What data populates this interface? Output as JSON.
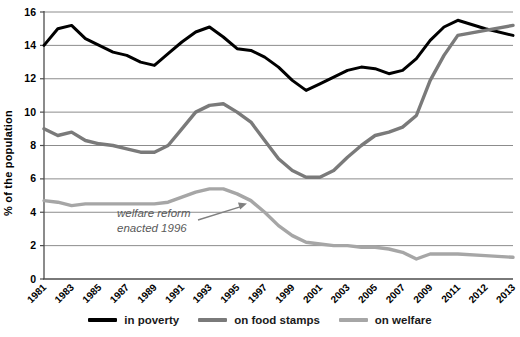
{
  "chart_data": {
    "type": "line",
    "title": "",
    "xlabel": "",
    "ylabel": "% of the population",
    "ylim": [
      0,
      16
    ],
    "ytick_interval": 2,
    "grid": "horizontal",
    "legend_position": "bottom",
    "x_tick_labels": [
      "1981",
      "1983",
      "1985",
      "1987",
      "1989",
      "1991",
      "1993",
      "1995",
      "1997",
      "1999",
      "2001",
      "2003",
      "2005",
      "2007",
      "2009",
      "2011",
      "2012",
      "2013"
    ],
    "years": [
      1981,
      1982,
      1983,
      1984,
      1985,
      1986,
      1987,
      1988,
      1989,
      1990,
      1991,
      1992,
      1993,
      1994,
      1995,
      1996,
      1997,
      1998,
      1999,
      2000,
      2001,
      2002,
      2003,
      2004,
      2005,
      2006,
      2007,
      2008,
      2009,
      2010,
      2011,
      2012,
      2013
    ],
    "series": [
      {
        "name": "in poverty",
        "color": "#000000",
        "values": [
          14.0,
          15.0,
          15.2,
          14.4,
          14.0,
          13.6,
          13.4,
          13.0,
          12.8,
          13.5,
          14.2,
          14.8,
          15.1,
          14.5,
          13.8,
          13.7,
          13.3,
          12.7,
          11.9,
          11.3,
          11.7,
          12.1,
          12.5,
          12.7,
          12.6,
          12.3,
          12.5,
          13.2,
          14.3,
          15.1,
          15.5,
          15.0,
          14.6
        ]
      },
      {
        "name": "on food stamps",
        "color": "#7a7a7a",
        "values": [
          9.0,
          8.6,
          8.8,
          8.3,
          8.1,
          8.0,
          7.8,
          7.6,
          7.6,
          8.0,
          9.0,
          10.0,
          10.4,
          10.5,
          10.0,
          9.4,
          8.3,
          7.2,
          6.5,
          6.1,
          6.1,
          6.5,
          7.3,
          8.0,
          8.6,
          8.8,
          9.1,
          9.8,
          11.9,
          13.4,
          14.6,
          14.9,
          15.2
        ]
      },
      {
        "name": "on welfare",
        "color": "#a6a6a6",
        "values": [
          4.7,
          4.6,
          4.4,
          4.5,
          4.5,
          4.5,
          4.5,
          4.5,
          4.5,
          4.6,
          4.9,
          5.2,
          5.4,
          5.4,
          5.1,
          4.7,
          4.0,
          3.2,
          2.6,
          2.2,
          2.1,
          2.0,
          2.0,
          1.9,
          1.9,
          1.8,
          1.6,
          1.2,
          1.5,
          1.5,
          1.5,
          1.4,
          1.3
        ]
      }
    ],
    "annotation": {
      "line1": "welfare reform",
      "line2": "enacted 1996",
      "target_year": 1996,
      "target_value": 4.7
    }
  },
  "styles": {
    "gridline_color": "#8c8c8c",
    "axis_color": "#4d4d4d",
    "tick_label_color": "#000000",
    "annotation_color": "#595959",
    "arrow_color": "#808080"
  }
}
